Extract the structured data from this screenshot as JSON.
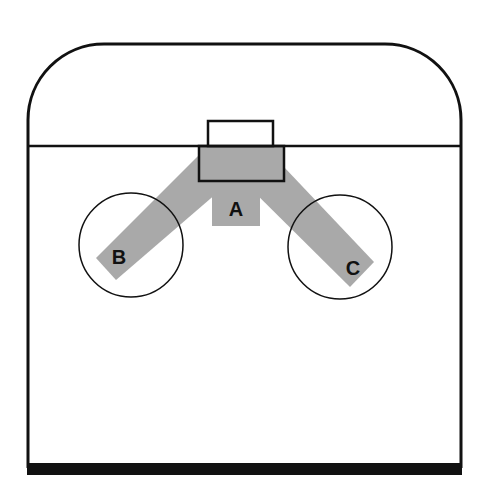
{
  "diagram": {
    "colors": {
      "background": "#ffffff",
      "outline": "#111111",
      "path_fill": "#a9a9a9",
      "label": "#111111"
    },
    "zones": {
      "A": {
        "label": "A"
      },
      "B": {
        "label": "B"
      },
      "C": {
        "label": "C"
      }
    }
  }
}
